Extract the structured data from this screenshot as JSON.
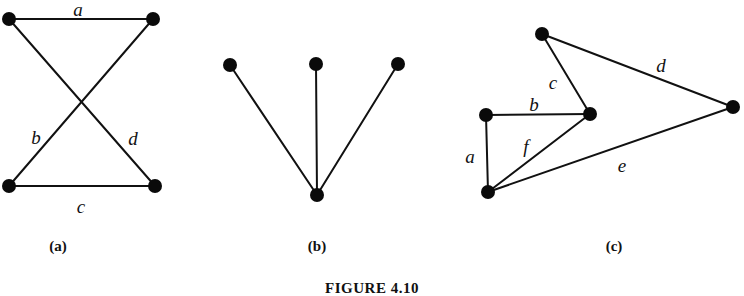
{
  "figure": {
    "caption": "FIGURE 4.10",
    "caption_x": 372,
    "caption_y": 281,
    "width": 744,
    "height": 292,
    "background_color": "#ffffff",
    "ink_color": "#111111",
    "vertex_color": "#0a0a0a"
  },
  "panels": [
    {
      "id": "panel-a",
      "label": "(a)",
      "label_x": 58,
      "label_y": 246,
      "vertices": [
        {
          "name": "a-top-left",
          "x": 9,
          "y": 19,
          "r": 7
        },
        {
          "name": "a-top-right",
          "x": 153,
          "y": 19,
          "r": 7
        },
        {
          "name": "a-bottom-left",
          "x": 9,
          "y": 186,
          "r": 7
        },
        {
          "name": "a-bottom-right",
          "x": 155,
          "y": 186,
          "r": 7
        }
      ],
      "edges": [
        {
          "name": "edge-a",
          "label": "a",
          "x1": 9,
          "y1": 19,
          "x2": 153,
          "y2": 19,
          "label_x": 78,
          "label_y": 9
        },
        {
          "name": "edge-b",
          "label": "b",
          "x1": 9,
          "y1": 19,
          "x2": 155,
          "y2": 186,
          "label_x": 36,
          "label_y": 137
        },
        {
          "name": "edge-d",
          "label": "d",
          "x1": 153,
          "y1": 19,
          "x2": 9,
          "y2": 186,
          "label_x": 133,
          "label_y": 138
        },
        {
          "name": "edge-c",
          "label": "c",
          "x1": 9,
          "y1": 186,
          "x2": 155,
          "y2": 186,
          "label_x": 81,
          "label_y": 206
        }
      ]
    },
    {
      "id": "panel-b",
      "label": "(b)",
      "label_x": 317,
      "label_y": 246,
      "vertices": [
        {
          "name": "b-top-left",
          "x": 230,
          "y": 65,
          "r": 7
        },
        {
          "name": "b-top-middle",
          "x": 316,
          "y": 64,
          "r": 7
        },
        {
          "name": "b-top-right",
          "x": 398,
          "y": 64,
          "r": 7
        },
        {
          "name": "b-bottom-center",
          "x": 317,
          "y": 195,
          "r": 7
        }
      ],
      "edges": [
        {
          "name": "edge-left-spoke",
          "label": "",
          "x1": 230,
          "y1": 65,
          "x2": 317,
          "y2": 195,
          "label_x": null,
          "label_y": null
        },
        {
          "name": "edge-middle-spoke",
          "label": "",
          "x1": 316,
          "y1": 64,
          "x2": 317,
          "y2": 195,
          "label_x": null,
          "label_y": null
        },
        {
          "name": "edge-right-spoke",
          "label": "",
          "x1": 398,
          "y1": 64,
          "x2": 317,
          "y2": 195,
          "label_x": null,
          "label_y": null
        }
      ]
    },
    {
      "id": "panel-c",
      "label": "(c)",
      "label_x": 614,
      "label_y": 246,
      "vertices": [
        {
          "name": "c-top",
          "x": 542,
          "y": 34,
          "r": 7
        },
        {
          "name": "c-left",
          "x": 486,
          "y": 115,
          "r": 7
        },
        {
          "name": "c-center",
          "x": 590,
          "y": 114,
          "r": 7
        },
        {
          "name": "c-right",
          "x": 733,
          "y": 107,
          "r": 7
        },
        {
          "name": "c-bottom",
          "x": 488,
          "y": 192,
          "r": 7
        }
      ],
      "edges": [
        {
          "name": "edge-a",
          "label": "a",
          "x1": 486,
          "y1": 115,
          "x2": 488,
          "y2": 192,
          "label_x": 470,
          "label_y": 156
        },
        {
          "name": "edge-b",
          "label": "b",
          "x1": 486,
          "y1": 115,
          "x2": 590,
          "y2": 114,
          "label_x": 534,
          "label_y": 104
        },
        {
          "name": "edge-c",
          "label": "c",
          "x1": 542,
          "y1": 34,
          "x2": 590,
          "y2": 114,
          "label_x": 553,
          "label_y": 82
        },
        {
          "name": "edge-d",
          "label": "d",
          "x1": 542,
          "y1": 34,
          "x2": 733,
          "y2": 107,
          "label_x": 661,
          "label_y": 65
        },
        {
          "name": "edge-e",
          "label": "e",
          "x1": 488,
          "y1": 192,
          "x2": 733,
          "y2": 107,
          "label_x": 622,
          "label_y": 165
        },
        {
          "name": "edge-f",
          "label": "f",
          "x1": 488,
          "y1": 192,
          "x2": 590,
          "y2": 114,
          "label_x": 526,
          "label_y": 146
        }
      ]
    }
  ]
}
